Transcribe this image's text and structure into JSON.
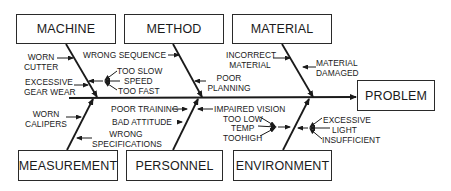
{
  "diagram": {
    "type": "fishbone",
    "effect": "PROBLEM",
    "categories": {
      "machine": {
        "label": "MACHINE",
        "causes": [
          {
            "text": "WORN\nCUTTER",
            "line1": "WORN",
            "line2": "CUTTER"
          },
          {
            "text": "EXCESSIVE\nGEAR WEAR",
            "line1": "EXCESSIVE",
            "line2": "GEAR WEAR"
          },
          {
            "text": "SPEED",
            "sub_causes": [
              "TOO SLOW",
              "TOO FAST"
            ]
          }
        ]
      },
      "method": {
        "label": "METHOD",
        "causes": [
          {
            "text": "WRONG SEQUENCE"
          },
          {
            "text": "POOR\nPLANNING",
            "line1": "POOR",
            "line2": "PLANNING"
          }
        ]
      },
      "material": {
        "label": "MATERIAL",
        "causes": [
          {
            "text": "INCORRECT\nMATERIAL",
            "line1": "INCORRECT",
            "line2": "MATERIAL"
          },
          {
            "text": "MATERIAL\nDAMAGED",
            "line1": "MATERIAL",
            "line2": "DAMAGED"
          }
        ]
      },
      "measurement": {
        "label": "MEASUREMENT",
        "causes": [
          {
            "text": "WORN\nCALIPERS",
            "line1": "WORN",
            "line2": "CALIPERS"
          },
          {
            "text": "WRONG\nSPECIFICATIONS",
            "line1": "WRONG",
            "line2": "SPECIFICATIONS"
          }
        ]
      },
      "personnel": {
        "label": "PERSONNEL",
        "causes": [
          {
            "text": "POOR TRAINING"
          },
          {
            "text": "BAD ATTITUDE"
          },
          {
            "text": "IMPAIRED VISION"
          }
        ]
      },
      "environment": {
        "label": "ENVIRONMENT",
        "causes": [
          {
            "text": "TEMP",
            "sub_causes": [
              "TOO LOW",
              "TOOHIGH"
            ]
          },
          {
            "text": "LIGHT",
            "sub_causes": [
              "EXCESSIVE",
              "INSUFFICIENT"
            ]
          }
        ]
      }
    }
  }
}
